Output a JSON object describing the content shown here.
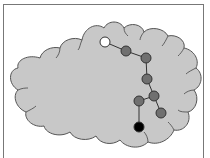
{
  "diagram": {
    "colors": {
      "cloud_fill": "#c8c8c8",
      "cloud_stroke": "#555555",
      "node_gray": "#707070",
      "node_start": "#ffffff",
      "node_end": "#000000",
      "edge": "#333333",
      "frame": "#777777"
    },
    "nodes": [
      {
        "id": "n0",
        "x": 105,
        "y": 42,
        "type": "start"
      },
      {
        "id": "n1",
        "x": 126,
        "y": 51,
        "type": "intermediate"
      },
      {
        "id": "n2",
        "x": 146,
        "y": 58,
        "type": "intermediate"
      },
      {
        "id": "n3",
        "x": 147,
        "y": 79,
        "type": "intermediate"
      },
      {
        "id": "n4",
        "x": 154,
        "y": 96,
        "type": "intermediate"
      },
      {
        "id": "n5",
        "x": 139,
        "y": 101,
        "type": "intermediate"
      },
      {
        "id": "n6",
        "x": 161,
        "y": 113,
        "type": "intermediate"
      },
      {
        "id": "n7",
        "x": 139,
        "y": 127,
        "type": "end"
      }
    ],
    "edges": [
      [
        "n0",
        "n1"
      ],
      [
        "n1",
        "n2"
      ],
      [
        "n2",
        "n3"
      ],
      [
        "n3",
        "n4"
      ],
      [
        "n4",
        "n5"
      ],
      [
        "n4",
        "n6"
      ],
      [
        "n5",
        "n7"
      ]
    ]
  }
}
